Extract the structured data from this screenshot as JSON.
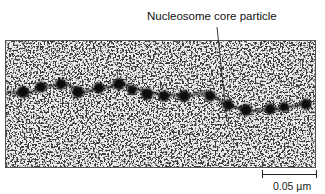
{
  "figure": {
    "annotation_label": "Nucleosome core particle",
    "scale_bar_label": "0.05 µm",
    "image_description": "Electron micrograph of chromatin showing a beads-on-a-string chain of nucleosome core particles on a speckled background",
    "bead_count": 15
  }
}
